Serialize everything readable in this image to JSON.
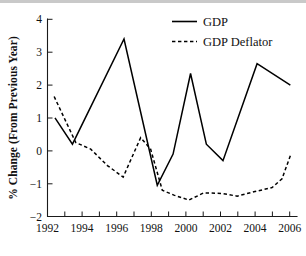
{
  "chart_data": {
    "type": "line",
    "title": "",
    "xlabel": "",
    "ylabel": "% Change (From Previous Year)",
    "xlim": [
      1992,
      2007
    ],
    "ylim": [
      -2,
      4
    ],
    "grid": false,
    "legend_position": "top-right",
    "x_tick_labels": [
      "1992",
      "1994",
      "1996",
      "1998",
      "2000",
      "2002",
      "2004",
      "2006"
    ],
    "x_tick_values": [
      1992,
      1994,
      1996,
      1998,
      2000,
      2002,
      2004,
      2006
    ],
    "x_minor_ticks": [
      1993,
      1995,
      1997,
      1999,
      2001,
      2003,
      2005,
      2007
    ],
    "y_tick_labels": [
      "4",
      "3",
      "2",
      "1",
      "0",
      "−1",
      "−2"
    ],
    "y_tick_values": [
      4,
      3,
      2,
      1,
      0,
      -1,
      -2
    ],
    "series": [
      {
        "name": "GDP",
        "style": "solid",
        "color": "#000000",
        "points": [
          [
            1992.45,
            1.0
          ],
          [
            1993.5,
            0.2
          ],
          [
            1996.6,
            3.4
          ],
          [
            1998.6,
            -1.05
          ],
          [
            1999.55,
            -0.1
          ],
          [
            2000.6,
            2.35
          ],
          [
            2001.55,
            0.2
          ],
          [
            2002.55,
            -0.3
          ],
          [
            2004.6,
            2.65
          ],
          [
            2006.6,
            2.0
          ]
        ]
      },
      {
        "name": "GDP Deflator",
        "style": "dashed",
        "color": "#000000",
        "points": [
          [
            1992.4,
            1.65
          ],
          [
            1993.7,
            0.25
          ],
          [
            1994.6,
            0.05
          ],
          [
            1995.6,
            -0.45
          ],
          [
            1996.55,
            -0.8
          ],
          [
            1997.6,
            0.4
          ],
          [
            1998.2,
            0.05
          ],
          [
            1998.9,
            -1.2
          ],
          [
            1999.6,
            -1.35
          ],
          [
            2000.5,
            -1.5
          ],
          [
            2001.4,
            -1.28
          ],
          [
            2002.5,
            -1.3
          ],
          [
            2003.4,
            -1.38
          ],
          [
            2004.4,
            -1.25
          ],
          [
            2005.5,
            -1.12
          ],
          [
            2006.1,
            -0.85
          ],
          [
            2006.6,
            -0.15
          ]
        ]
      }
    ]
  },
  "legend": {
    "entries": [
      {
        "label": "GDP",
        "style": "solid"
      },
      {
        "label": "GDP Deflator",
        "style": "dashed"
      }
    ]
  },
  "axes": {
    "y_axis_title": "% Change (From Previous Year)"
  }
}
